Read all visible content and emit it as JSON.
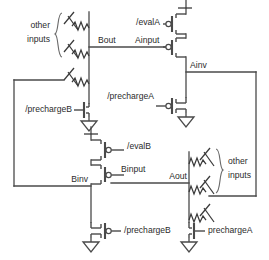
{
  "diagram": {
    "type": "circuit-schematic",
    "stroke_color": "#4a4a4a",
    "background_color": "#ffffff"
  },
  "labels": {
    "other_inputs_top_line1": "other",
    "other_inputs_top_line2": "inputs",
    "other_inputs_bottom_line1": "other",
    "other_inputs_bottom_line2": "inputs",
    "bout": "Bout",
    "ainput": "Ainput",
    "ainv": "Ainv",
    "binv": "Binv",
    "binput": "Binput",
    "aout": "Aout",
    "eval_a": "/evalA",
    "eval_b": "/evalB",
    "precharge_a_inverter": "/prechargeA",
    "precharge_b_inverter": "/prechargeB",
    "precharge_b_pulldown": "/prechargeB",
    "precharge_a_pulldown": "prechargeA"
  },
  "nets": [
    {
      "name": "Bout",
      "label": "Bout"
    },
    {
      "name": "Ainput",
      "label": "Ainput"
    },
    {
      "name": "Ainv",
      "label": "Ainv"
    },
    {
      "name": "Binv",
      "label": "Binv"
    },
    {
      "name": "Binput",
      "label": "Binput"
    },
    {
      "name": "Aout",
      "label": "Aout"
    }
  ],
  "devices": [
    {
      "id": "m-eval-a",
      "type": "pmos",
      "gate_label": "/evalA"
    },
    {
      "id": "m-ainput",
      "type": "pmos",
      "gate_label": "Ainput"
    },
    {
      "id": "m-precharge-a",
      "type": "nmos",
      "gate_label": "/prechargeA"
    },
    {
      "id": "m-eval-b",
      "type": "pmos",
      "gate_label": "/evalB"
    },
    {
      "id": "m-binput",
      "type": "pmos",
      "gate_label": "Binput"
    },
    {
      "id": "m-precharge-b",
      "type": "nmos",
      "gate_label": "/prechargeB"
    },
    {
      "id": "m-pulldown-b",
      "type": "nmos",
      "gate_label": "/prechargeB"
    },
    {
      "id": "m-pulldown-a",
      "type": "nmos",
      "gate_label": "prechargeA"
    }
  ],
  "pulldown_networks": [
    {
      "id": "pdn-b",
      "branch_count": 3,
      "braced_count": 2,
      "note": "other inputs"
    },
    {
      "id": "pdn-a",
      "branch_count": 3,
      "braced_count": 2,
      "note": "other inputs"
    }
  ]
}
